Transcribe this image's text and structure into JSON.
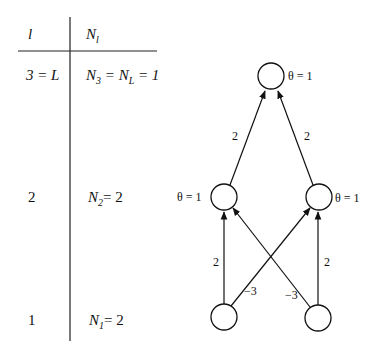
{
  "table": {
    "header": {
      "col1": "l",
      "col2_main": "N",
      "col2_sub": "l"
    },
    "rows": [
      {
        "layer": "3 = L",
        "count_main": "N",
        "count_sub": "3",
        "count_rest": " = N",
        "count_sub2": "L",
        "count_tail": " = 1"
      },
      {
        "layer": "2",
        "count_main": "N",
        "count_sub": "2",
        "count_rest": "=  2"
      },
      {
        "layer": "1",
        "count_main": "N",
        "count_sub": "1",
        "count_rest": "= 2"
      }
    ]
  },
  "network": {
    "nodes": [
      {
        "id": "output",
        "layer": 3,
        "threshold_label": "θ = 1"
      },
      {
        "id": "hidden-left",
        "layer": 2,
        "threshold_label": "θ = 1"
      },
      {
        "id": "hidden-right",
        "layer": 2,
        "threshold_label": "θ = 1"
      },
      {
        "id": "input-left",
        "layer": 1
      },
      {
        "id": "input-right",
        "layer": 1
      }
    ],
    "edges": [
      {
        "from": "hidden-left",
        "to": "output",
        "weight": "2"
      },
      {
        "from": "hidden-right",
        "to": "output",
        "weight": "2"
      },
      {
        "from": "input-left",
        "to": "hidden-left",
        "weight": "2"
      },
      {
        "from": "input-right",
        "to": "hidden-right",
        "weight": "2"
      },
      {
        "from": "input-left",
        "to": "hidden-right",
        "weight": "−3"
      },
      {
        "from": "input-right",
        "to": "hidden-left",
        "weight": "−3"
      }
    ]
  }
}
